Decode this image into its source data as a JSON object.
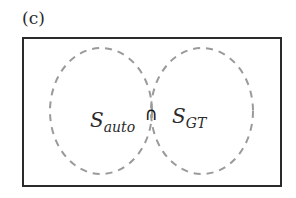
{
  "panel": {
    "label": "(c)"
  },
  "diagram": {
    "type": "venn",
    "frame": {
      "x": 23,
      "y": 38,
      "width": 258,
      "height": 148,
      "stroke": "#2a2a2a"
    },
    "sets": [
      {
        "name": "S",
        "subscript": "auto",
        "cx": 101,
        "cy": 111,
        "rx": 51,
        "ry": 63,
        "stroke": "#9a9a9a",
        "dash": "dashed"
      },
      {
        "name": "S",
        "subscript": "GT",
        "cx": 202,
        "cy": 111,
        "rx": 51,
        "ry": 63,
        "stroke": "#9a9a9a",
        "dash": "dashed"
      }
    ],
    "intersection": {
      "symbol": "∩",
      "fill": "#8c8c8c"
    }
  }
}
